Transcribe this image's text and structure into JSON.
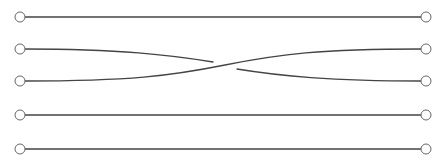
{
  "diagram": {
    "type": "braid",
    "strand_count": 5,
    "colors": {
      "strand": "#444444",
      "endpoint_stroke": "#666666",
      "background": "#ffffff"
    },
    "left_x": 20,
    "right_x": 426,
    "endpoint_radius": 5,
    "strand_y": [
      17,
      49,
      81,
      115,
      149
    ],
    "crossings": [
      {
        "between_strands": [
          2,
          3
        ],
        "over": "strand 3 (bottom-left to top-right)",
        "under": "strand 2 (top-left to bottom-right)",
        "x_center": 225
      }
    ]
  }
}
